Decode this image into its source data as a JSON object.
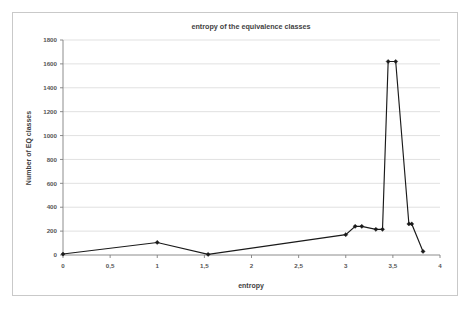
{
  "chart_data": {
    "type": "line",
    "title": "entropy of the equivalence classes",
    "xlabel": "entropy",
    "ylabel": "Number of EQ classes",
    "xlim": [
      0,
      4
    ],
    "ylim": [
      0,
      1800
    ],
    "grid": true,
    "legend": "none",
    "marker": "diamond",
    "line_color": "#1a1a1a",
    "xticks": [
      0,
      0.5,
      1,
      1.5,
      2,
      2.5,
      3,
      3.5,
      4
    ],
    "xtick_labels": [
      "0",
      "0,5",
      "1",
      "1,5",
      "2",
      "2,5",
      "3",
      "3,5",
      "4"
    ],
    "yticks": [
      0,
      200,
      400,
      600,
      800,
      1000,
      1200,
      1400,
      1600,
      1800
    ],
    "ytick_labels": [
      "0",
      "200",
      "400",
      "600",
      "800",
      "1000",
      "1200",
      "1400",
      "1600",
      "1800"
    ],
    "x": [
      0.0,
      1.0,
      1.54,
      3.0,
      3.1,
      3.17,
      3.32,
      3.39,
      3.45,
      3.53,
      3.67,
      3.7,
      3.82
    ],
    "y": [
      8,
      105,
      5,
      170,
      240,
      240,
      215,
      215,
      1620,
      1620,
      260,
      260,
      30
    ],
    "series": [
      {
        "name": "Number of EQ classes",
        "points": [
          {
            "x": 0.0,
            "y": 8
          },
          {
            "x": 1.0,
            "y": 105
          },
          {
            "x": 1.54,
            "y": 5
          },
          {
            "x": 3.0,
            "y": 170
          },
          {
            "x": 3.1,
            "y": 240
          },
          {
            "x": 3.17,
            "y": 240
          },
          {
            "x": 3.32,
            "y": 215
          },
          {
            "x": 3.39,
            "y": 215
          },
          {
            "x": 3.45,
            "y": 1620
          },
          {
            "x": 3.53,
            "y": 1620
          },
          {
            "x": 3.67,
            "y": 260
          },
          {
            "x": 3.7,
            "y": 260
          },
          {
            "x": 3.82,
            "y": 30
          }
        ]
      }
    ]
  }
}
